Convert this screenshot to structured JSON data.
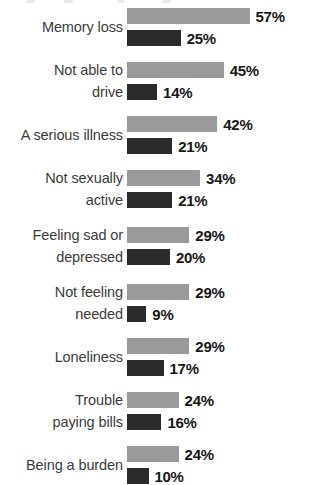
{
  "chart_data": {
    "type": "bar",
    "title": "",
    "xlabel": "",
    "ylabel": "",
    "orientation": "horizontal",
    "grid": false,
    "legend_position": "none",
    "value_suffix": "%",
    "xlim": [
      0,
      60
    ],
    "categories": [
      "Memory loss",
      "Not able to\ndrive",
      "A serious illness",
      "Not sexually\nactive",
      "Feeling sad or\ndepressed",
      "Not feeling\nneeded",
      "Loneliness",
      "Trouble\npaying bills",
      "Being a burden"
    ],
    "series": [
      {
        "name": "light",
        "color": "#9a9a9a",
        "values": [
          57,
          45,
          42,
          34,
          29,
          29,
          29,
          24,
          24
        ],
        "labels": [
          "57%",
          "45%",
          "42%",
          "34%",
          "29%",
          "29%",
          "29%",
          "24%",
          "24%"
        ]
      },
      {
        "name": "dark",
        "color": "#2b2b2b",
        "values": [
          25,
          14,
          21,
          21,
          20,
          9,
          17,
          16,
          10
        ],
        "labels": [
          "25%",
          "14%",
          "21%",
          "21%",
          "20%",
          "9%",
          "17%",
          "16%",
          "10%"
        ]
      }
    ]
  },
  "style": {
    "background": "#ffffff",
    "label_color": "#3b3b3b",
    "value_color": "#171717",
    "px_per_percent": 2.15
  }
}
